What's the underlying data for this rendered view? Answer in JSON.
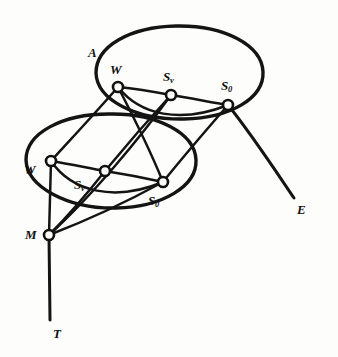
{
  "figure": {
    "type": "line-diagram",
    "ink_color": "#141414",
    "paper_color": "#fdfdfb"
  },
  "regions": [
    {
      "id": "region-a",
      "label": "A",
      "x": 88,
      "y": 46
    }
  ],
  "nodes": [
    {
      "id": "upper-w",
      "label": "W",
      "sub": "",
      "cx": 118,
      "cy": 87,
      "r": 5.0,
      "label_x": 110,
      "label_y": 63
    },
    {
      "id": "upper-sv",
      "label": "S",
      "sub": "v",
      "cx": 171,
      "cy": 95,
      "r": 5.0,
      "label_x": 163,
      "label_y": 70
    },
    {
      "id": "upper-s0",
      "label": "S",
      "sub": "0",
      "cx": 228,
      "cy": 105,
      "r": 5.0,
      "label_x": 221,
      "label_y": 79
    },
    {
      "id": "lower-w",
      "label": "W",
      "sub": "",
      "cx": 51,
      "cy": 161,
      "r": 5.0,
      "label_x": 24,
      "label_y": 163
    },
    {
      "id": "lower-sv",
      "label": "S",
      "sub": "v",
      "cx": 105,
      "cy": 171,
      "r": 5.0,
      "label_x": 74,
      "label_y": 178
    },
    {
      "id": "lower-s0",
      "label": "S",
      "sub": "0",
      "cx": 163,
      "cy": 182,
      "r": 5.0,
      "label_x": 148,
      "label_y": 194
    },
    {
      "id": "node-m",
      "label": "M",
      "sub": "",
      "cx": 49,
      "cy": 235,
      "r": 5.0,
      "label_x": 25,
      "label_y": 228
    }
  ],
  "terminals": [
    {
      "id": "terminal-e",
      "label": "E",
      "x": 297,
      "y": 203
    },
    {
      "id": "terminal-t",
      "label": "T",
      "x": 53,
      "y": 327
    }
  ],
  "labels": {
    "region_a": "A",
    "upper_w": "W",
    "upper_sv": "Sv",
    "upper_s0": "S0",
    "lower_w": "W",
    "lower_sv": "Sv",
    "lower_s0": "S0",
    "node_m": "M",
    "terminal_e": "E",
    "terminal_t": "T"
  }
}
